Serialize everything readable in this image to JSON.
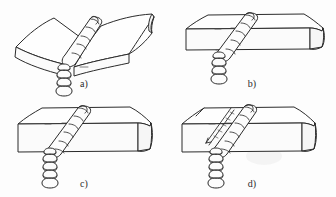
{
  "figure": {
    "background_color": "#fdfdfd",
    "line_color": "#2b2b2b",
    "face_fill": "#fefefe",
    "panel_count": 4
  },
  "panels": [
    {
      "id": "a",
      "caption": "a)",
      "name": "angular-distortion-joint",
      "description": "Two plates butt-welded and bent upward at the weld, showing angular distortion",
      "plate_shape": "bent",
      "has_crack": false,
      "bead_segments_top": 5,
      "bead_segments_front": 5
    },
    {
      "id": "b",
      "caption": "b)",
      "name": "flat-butt-joint-thin",
      "description": "Two flat plates butt-welded, weld bead crossing the top and front faces",
      "plate_shape": "flat",
      "has_crack": false,
      "bead_segments_top": 5,
      "bead_segments_front": 5
    },
    {
      "id": "c",
      "caption": "c)",
      "name": "flat-butt-joint-thick",
      "description": "Two flat thicker plates butt-welded, weld bead crossing the top and front faces",
      "plate_shape": "flat",
      "has_crack": false,
      "bead_segments_top": 6,
      "bead_segments_front": 6
    },
    {
      "id": "d",
      "caption": "d)",
      "name": "butt-joint-with-crack",
      "description": "Two flat plates butt-welded with a longitudinal crack beside the weld bead on the top face",
      "plate_shape": "flat",
      "has_crack": true,
      "crack_label": "longitudinal crack",
      "bead_segments_top": 6,
      "bead_segments_front": 6
    }
  ]
}
